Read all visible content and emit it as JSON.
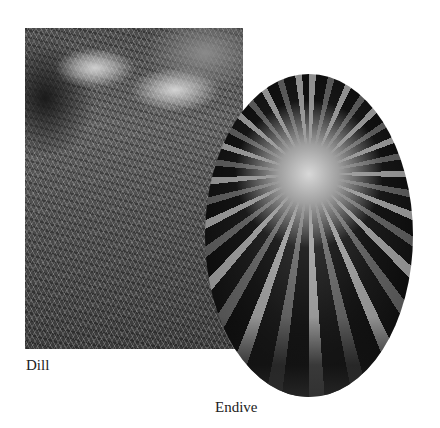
{
  "figures": [
    {
      "id": "dill",
      "caption": "Dill",
      "shape": "rectangle",
      "tone": "grayscale"
    },
    {
      "id": "endive",
      "caption": "Endive",
      "shape": "ellipse",
      "tone": "grayscale"
    }
  ]
}
